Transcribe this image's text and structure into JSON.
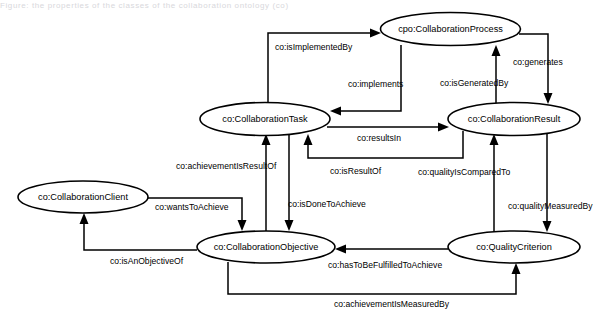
{
  "figure": {
    "kind": "ontology-graph",
    "width": 614,
    "height": 315,
    "background_color": "#ffffff",
    "stroke_color": "#000000",
    "text_color": "#000000",
    "top_clipped_text": "Figure: the properties of the classes of the collaboration ontology (co)"
  },
  "nodes": [
    {
      "id": "collaboration-process",
      "label": "cpo:CollaborationProcess",
      "cx": 450.5,
      "cy": 29,
      "rx": 70,
      "ry": 16.5
    },
    {
      "id": "collaboration-task",
      "label": "co:CollaborationTask",
      "cx": 265,
      "cy": 119,
      "rx": 65,
      "ry": 16.5
    },
    {
      "id": "collaboration-result",
      "label": "co:CollaborationResult",
      "cx": 514,
      "cy": 119,
      "rx": 66,
      "ry": 16.5
    },
    {
      "id": "collaboration-client",
      "label": "co:CollaborationClient",
      "cx": 83,
      "cy": 197,
      "rx": 65,
      "ry": 16
    },
    {
      "id": "collaboration-objective",
      "label": "co:CollaborationObjective",
      "cx": 266,
      "cy": 247,
      "rx": 69,
      "ry": 16
    },
    {
      "id": "quality-criterion",
      "label": "co:QualityCriterion",
      "cx": 514,
      "cy": 247,
      "rx": 66,
      "ry": 16
    }
  ],
  "edges": [
    {
      "id": "is-implemented-by",
      "label": "co:isImplementedBy",
      "from": "collaboration-task",
      "to": "collaboration-process",
      "label_x": 275,
      "label_y": 48,
      "label_anchor": "start"
    },
    {
      "id": "implements",
      "label": "co:implements",
      "from": "collaboration-process",
      "to": "collaboration-task",
      "label_x": 348,
      "label_y": 85,
      "label_anchor": "start"
    },
    {
      "id": "is-generated-by",
      "label": "co:isGeneratedBy",
      "from": "collaboration-result",
      "to": "collaboration-process",
      "label_x": 440,
      "label_y": 84,
      "label_anchor": "start"
    },
    {
      "id": "generates",
      "label": "co:generates",
      "from": "collaboration-process",
      "to": "collaboration-result",
      "label_x": 513,
      "label_y": 63,
      "label_anchor": "start"
    },
    {
      "id": "results-in",
      "label": "co:resultsIn",
      "from": "collaboration-task",
      "to": "collaboration-result",
      "label_x": 357,
      "label_y": 139,
      "label_anchor": "start"
    },
    {
      "id": "is-result-of",
      "label": "co:isResultOf",
      "from": "collaboration-result",
      "to": "collaboration-task",
      "label_x": 330,
      "label_y": 172,
      "label_anchor": "start"
    },
    {
      "id": "quality-is-compared-to",
      "label": "co:qualityIsComparedTo",
      "from": "collaboration-result",
      "to": "quality-criterion",
      "label_x": 418,
      "label_y": 173,
      "label_anchor": "start"
    },
    {
      "id": "quality-measured-by",
      "label": "co:qualityMeasuredBy",
      "from": "collaboration-result",
      "to": "quality-criterion",
      "label_x": 508,
      "label_y": 207,
      "label_anchor": "start"
    },
    {
      "id": "achievement-is-result-of",
      "label": "co:achievementIsResultOf",
      "from": "collaboration-objective",
      "to": "collaboration-task",
      "label_x": 176,
      "label_y": 167,
      "label_anchor": "start"
    },
    {
      "id": "is-done-to-achieve",
      "label": "co:isDoneToAchieve",
      "from": "collaboration-task",
      "to": "collaboration-objective",
      "label_x": 288,
      "label_y": 205,
      "label_anchor": "start"
    },
    {
      "id": "wants-to-achieve",
      "label": "co:wantsToAchieve",
      "from": "collaboration-client",
      "to": "collaboration-objective",
      "label_x": 155,
      "label_y": 208,
      "label_anchor": "start"
    },
    {
      "id": "is-an-objective-of",
      "label": "co:isAnObjectiveOf",
      "from": "collaboration-objective",
      "to": "collaboration-client",
      "label_x": 110,
      "label_y": 262,
      "label_anchor": "start"
    },
    {
      "id": "has-to-be-fulfilled-to-achieve",
      "label": "co:hasToBeFulfilledToAchieve",
      "from": "quality-criterion",
      "to": "collaboration-objective",
      "label_x": 328,
      "label_y": 266,
      "label_anchor": "start"
    },
    {
      "id": "achievement-is-measured-by",
      "label": "co:achievementIsMeasuredBy",
      "from": "collaboration-objective",
      "to": "quality-criterion",
      "label_x": 334,
      "label_y": 305,
      "label_anchor": "start"
    }
  ]
}
